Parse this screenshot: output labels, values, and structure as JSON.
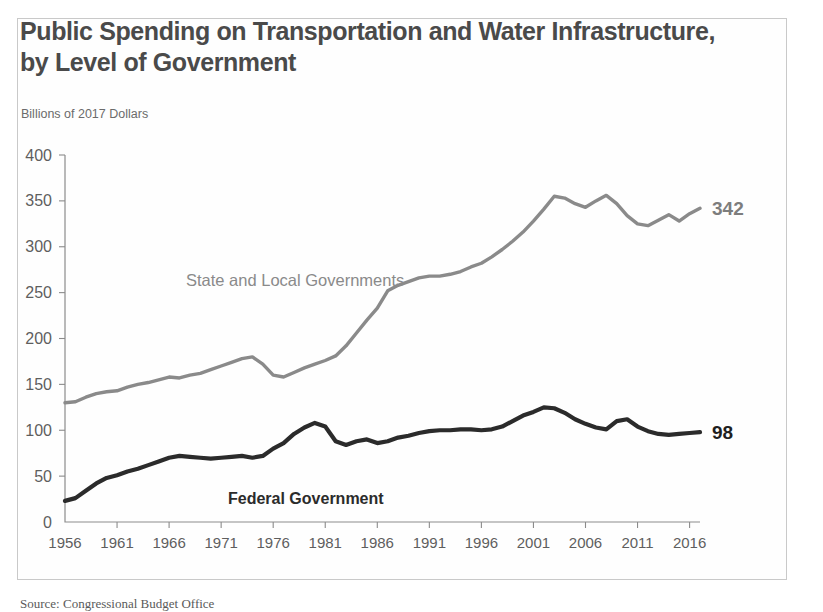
{
  "chart_data": {
    "type": "line",
    "title": "Public Spending on Transportation and Water Infrastructure, by Level of Government",
    "subtitle": "Billions of 2017 Dollars",
    "xlabel": "",
    "ylabel": "Billions of 2017 Dollars",
    "xlim": [
      1956,
      2017
    ],
    "ylim": [
      0,
      400
    ],
    "ytick_labels": [
      "0",
      "50",
      "100",
      "150",
      "200",
      "250",
      "300",
      "350",
      "400"
    ],
    "yticks": [
      0,
      50,
      100,
      150,
      200,
      250,
      300,
      350,
      400
    ],
    "xtick_labels": [
      "1956",
      "1961",
      "1966",
      "1971",
      "1976",
      "1981",
      "1986",
      "1991",
      "1996",
      "2001",
      "2006",
      "2011",
      "2016"
    ],
    "xticks": [
      1956,
      1961,
      1966,
      1971,
      1976,
      1981,
      1986,
      1991,
      1996,
      2001,
      2006,
      2011,
      2016
    ],
    "grid": false,
    "legend_position": "inline-annotation",
    "x": [
      1956,
      1957,
      1958,
      1959,
      1960,
      1961,
      1962,
      1963,
      1964,
      1965,
      1966,
      1967,
      1968,
      1969,
      1970,
      1971,
      1972,
      1973,
      1974,
      1975,
      1976,
      1977,
      1978,
      1979,
      1980,
      1981,
      1982,
      1983,
      1984,
      1985,
      1986,
      1987,
      1988,
      1989,
      1990,
      1991,
      1992,
      1993,
      1994,
      1995,
      1996,
      1997,
      1998,
      1999,
      2000,
      2001,
      2002,
      2003,
      2004,
      2005,
      2006,
      2007,
      2008,
      2009,
      2010,
      2011,
      2012,
      2013,
      2014,
      2015,
      2016,
      2017
    ],
    "series": [
      {
        "name": "State and Local Governments",
        "color": "#8a8a8a",
        "end_label": "342",
        "values": [
          130,
          131,
          136,
          140,
          142,
          143,
          147,
          150,
          152,
          155,
          158,
          157,
          160,
          162,
          166,
          170,
          174,
          178,
          180,
          172,
          160,
          158,
          163,
          168,
          172,
          176,
          181,
          192,
          206,
          220,
          233,
          252,
          258,
          262,
          266,
          268,
          268,
          270,
          273,
          278,
          282,
          289,
          297,
          306,
          316,
          328,
          341,
          355,
          353,
          347,
          343,
          350,
          356,
          347,
          334,
          325,
          323,
          329,
          335,
          328,
          336,
          342
        ]
      },
      {
        "name": "Federal Government",
        "color": "#2b2b2b",
        "end_label": "98",
        "values": [
          23,
          26,
          34,
          42,
          48,
          51,
          55,
          58,
          62,
          66,
          70,
          72,
          71,
          70,
          69,
          70,
          71,
          72,
          70,
          72,
          80,
          86,
          96,
          103,
          108,
          104,
          88,
          84,
          88,
          90,
          86,
          88,
          92,
          94,
          97,
          99,
          100,
          100,
          101,
          101,
          100,
          101,
          104,
          110,
          116,
          120,
          125,
          124,
          119,
          112,
          107,
          103,
          101,
          110,
          112,
          104,
          99,
          96,
          95,
          96,
          97,
          98
        ]
      }
    ],
    "annotations": [
      {
        "text": "State and Local Governments",
        "series": "state"
      },
      {
        "text": "Federal Government",
        "series": "federal"
      }
    ]
  },
  "source": {
    "text": "Source: Congressional Budget Office"
  }
}
